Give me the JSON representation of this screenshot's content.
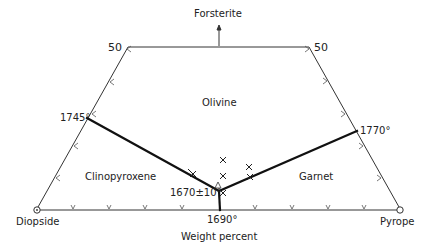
{
  "diagram": {
    "title_arrow_label": "Forsterite",
    "axis_label": "Weight percent",
    "corners": {
      "left": "Diopside",
      "right": "Pyrope"
    },
    "edge_labels": {
      "top_left": "50",
      "top_right": "50"
    },
    "fields": {
      "olivine": "Olivine",
      "clinopyroxene": "Clinopyroxene",
      "garnet": "Garnet"
    },
    "temperatures": {
      "left_boundary": "1745°",
      "right_boundary": "1770°",
      "bottom": "1690°",
      "triple_point": "1670±10°"
    },
    "triple_point_label": "A",
    "colors": {
      "line": "#222222",
      "boundary": "#111111",
      "background": "#ffffff"
    }
  }
}
